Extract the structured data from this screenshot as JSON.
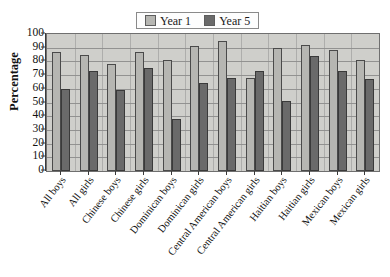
{
  "chart_data": {
    "type": "bar",
    "title": "",
    "xlabel": "",
    "ylabel": "Percentage",
    "ylim": [
      0,
      100
    ],
    "ytick_step": 10,
    "yticks": [
      100,
      90,
      80,
      70,
      60,
      50,
      40,
      30,
      20,
      10,
      0
    ],
    "grid": true,
    "legend_position": "top-center",
    "categories": [
      "All boys",
      "All girls",
      "Chinese boys",
      "Chinese girls",
      "Dominican boys",
      "Dominican girls",
      "Central American boys",
      "Central American girls",
      "Haitian boys",
      "Haitian girls",
      "Mexican boys",
      "Mexican girls"
    ],
    "series": [
      {
        "name": "Year 1",
        "color": "#b6b6b2",
        "values": [
          87,
          85,
          78,
          87,
          81,
          91,
          95,
          68,
          90,
          92,
          88,
          81
        ]
      },
      {
        "name": "Year 5",
        "color": "#6a6a6a",
        "values": [
          60,
          73,
          59,
          75,
          38,
          64,
          68,
          73,
          51,
          84,
          73,
          67
        ]
      }
    ]
  },
  "legend": {
    "entries": [
      {
        "label": "Year 1"
      },
      {
        "label": "Year 5"
      }
    ]
  },
  "axes": {
    "y_title": "Percentage"
  }
}
